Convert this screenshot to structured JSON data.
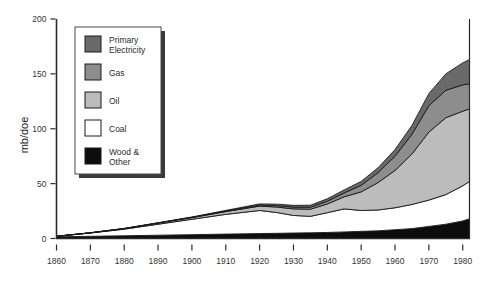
{
  "chart_data": {
    "type": "area",
    "title": "",
    "xlabel": "",
    "ylabel": "mb/doe",
    "xlim": [
      1860,
      1982
    ],
    "ylim": [
      0,
      200
    ],
    "grid": false,
    "legend_position": "top-left-inside",
    "stacked": true,
    "stack_order_bottom_to_top": [
      "Wood & Other",
      "Coal",
      "Oil",
      "Gas",
      "Primary Electricity"
    ],
    "x_ticks": [
      1860,
      1870,
      1880,
      1890,
      1900,
      1910,
      1920,
      1930,
      1940,
      1950,
      1960,
      1970,
      1980
    ],
    "y_ticks": [
      0,
      50,
      100,
      150,
      200
    ],
    "x": [
      1860,
      1870,
      1880,
      1890,
      1900,
      1910,
      1920,
      1925,
      1930,
      1935,
      1940,
      1945,
      1950,
      1955,
      1960,
      1965,
      1970,
      1975,
      1980,
      1982
    ],
    "series": [
      {
        "name": "Wood & Other",
        "color": "#0d0d0d",
        "values": [
          1.5,
          2.0,
          2.5,
          3.0,
          3.5,
          4.0,
          4.5,
          4.7,
          5.0,
          5.2,
          5.5,
          6.0,
          6.5,
          7.0,
          8.0,
          9.0,
          11.0,
          13.0,
          16.0,
          18.0
        ]
      },
      {
        "name": "Coal",
        "color": "#ffffff",
        "values": [
          0.5,
          3.0,
          6.0,
          10.0,
          14.0,
          18.0,
          21.0,
          19.0,
          16.0,
          15.0,
          18.0,
          21.0,
          19.0,
          19.0,
          20.0,
          22.0,
          24.0,
          27.0,
          32.0,
          34.0
        ]
      },
      {
        "name": "Oil",
        "color": "#bcbcbc",
        "values": [
          0.0,
          0.2,
          0.5,
          1.0,
          1.5,
          2.5,
          4.0,
          5.0,
          6.0,
          6.5,
          8.0,
          11.0,
          17.0,
          25.0,
          34.0,
          46.0,
          62.0,
          70.0,
          68.0,
          66.0
        ]
      },
      {
        "name": "Gas",
        "color": "#8d8d8d",
        "values": [
          0.0,
          0.0,
          0.1,
          0.2,
          0.3,
          0.5,
          1.0,
          1.3,
          1.6,
          1.8,
          2.5,
          3.5,
          6.0,
          9.0,
          13.0,
          18.0,
          24.0,
          25.0,
          24.0,
          23.0
        ]
      },
      {
        "name": "Primary Electricity",
        "color": "#6a6a6a",
        "values": [
          0.0,
          0.0,
          0.0,
          0.1,
          0.3,
          0.6,
          1.0,
          1.3,
          1.6,
          1.8,
          2.2,
          2.8,
          3.5,
          4.5,
          6.0,
          8.0,
          11.0,
          15.0,
          20.0,
          22.0
        ]
      }
    ],
    "legend_entries": [
      {
        "label": "Primary Electricity",
        "color": "#6a6a6a"
      },
      {
        "label": "Gas",
        "color": "#8d8d8d"
      },
      {
        "label": "Oil",
        "color": "#bcbcbc"
      },
      {
        "label": "Coal",
        "color": "#ffffff"
      },
      {
        "label": "Wood & Other",
        "color": "#0d0d0d"
      }
    ]
  },
  "axis": {
    "y_title": "mb/doe",
    "y_tick_labels": [
      "0",
      "50",
      "100",
      "150",
      "200"
    ],
    "x_tick_labels": [
      "1860",
      "1870",
      "1880",
      "1890",
      "1900",
      "1910",
      "1920",
      "1930",
      "1940",
      "1950",
      "1960",
      "1970",
      "1980"
    ]
  },
  "legend": {
    "item_0_label": "Primary",
    "item_0_label2": "Electricity",
    "item_1_label": "Gas",
    "item_2_label": "Oil",
    "item_3_label": "Coal",
    "item_4_label": "Wood &",
    "item_4_label2": "Other"
  },
  "colors": {
    "primary_electricity": "#6a6a6a",
    "gas": "#8d8d8d",
    "oil": "#bcbcbc",
    "coal": "#ffffff",
    "wood_other": "#0d0d0d",
    "axis": "#2a2a2a",
    "outline": "#1a1a1a",
    "legend_shadow": "#3a3a3a"
  }
}
